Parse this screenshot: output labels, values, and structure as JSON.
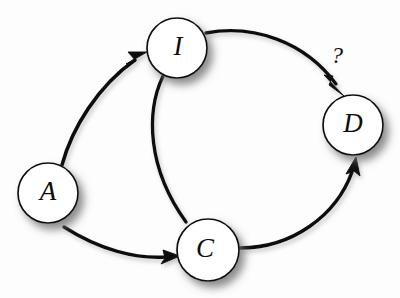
{
  "diagram": {
    "background_color": "#fdfdfd",
    "stroke_color": "#111111",
    "node_fill_color": "#ffffff",
    "nodes": [
      {
        "id": "A",
        "label": "A",
        "cx": 48,
        "cy": 193,
        "r": 30
      },
      {
        "id": "I",
        "label": "I",
        "cx": 177,
        "cy": 48,
        "r": 30
      },
      {
        "id": "D",
        "label": "D",
        "cx": 353,
        "cy": 125,
        "r": 30
      },
      {
        "id": "C",
        "label": "C",
        "cx": 208,
        "cy": 250,
        "r": 31
      }
    ],
    "edges": [
      {
        "id": "a-to-i",
        "from": "A",
        "to": "I",
        "arrow": true,
        "label": ""
      },
      {
        "id": "i-to-d",
        "from": "I",
        "to": "D",
        "arrow": true,
        "label": "?"
      },
      {
        "id": "i-to-c",
        "from": "I",
        "to": "C",
        "arrow": false,
        "label": ""
      },
      {
        "id": "a-to-c",
        "from": "A",
        "to": "C",
        "arrow": true,
        "label": ""
      },
      {
        "id": "c-to-d",
        "from": "C",
        "to": "D",
        "arrow": true,
        "label": ""
      }
    ],
    "labels": {
      "question_mark": "?"
    }
  }
}
